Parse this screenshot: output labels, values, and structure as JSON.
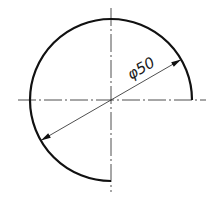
{
  "drawing": {
    "type": "technical-drawing",
    "shape": "three-quarter circular arc",
    "arc_sweep_degrees": 270,
    "dimension": {
      "label": "φ50",
      "kind": "diameter",
      "value": 50
    },
    "colors": {
      "line": "#111111",
      "thin_line": "#222222",
      "background": "#ffffff"
    }
  }
}
